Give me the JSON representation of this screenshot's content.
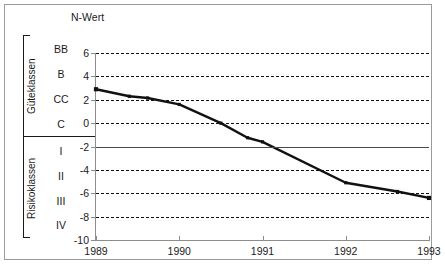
{
  "chart_data": {
    "type": "line",
    "title": "N-Wert",
    "xlabel": "",
    "ylabel": "N-Wert",
    "xlim": [
      1989,
      1993
    ],
    "ylim": [
      -10,
      6
    ],
    "grid": true,
    "legend": null,
    "y_ticks": [
      6,
      4,
      2,
      0,
      -2,
      -4,
      -6,
      -8,
      -10
    ],
    "y_tick_labels": [
      "6",
      "4",
      "2",
      "0",
      "-2",
      "-4",
      "-6",
      "-8",
      "-10"
    ],
    "x_ticks": [
      1989,
      1990,
      1991,
      1992,
      1993
    ],
    "x_tick_labels": [
      "1989",
      "1990",
      "1991",
      "1992",
      "1993"
    ],
    "threshold_line": {
      "value": -2,
      "style": "solid",
      "label": ""
    },
    "series": [
      {
        "name": "N-Wert",
        "color": "#111111",
        "marker": "square",
        "x": [
          1989.0,
          1989.4,
          1989.62,
          1990.0,
          1990.5,
          1990.82,
          1991.0,
          1992.0,
          1992.62,
          1993.0
        ],
        "values": [
          2.9,
          2.3,
          2.15,
          1.6,
          0.0,
          -1.25,
          -1.6,
          -5.1,
          -5.85,
          -6.4
        ]
      }
    ]
  },
  "axis": {
    "title": "N-Wert"
  },
  "classes": {
    "quality": {
      "group_label": "Güteklassen",
      "items": [
        "BB",
        "B",
        "CC",
        "C"
      ]
    },
    "risk": {
      "group_label": "Risikoklassen",
      "items": [
        "I",
        "II",
        "III",
        "IV"
      ]
    }
  }
}
